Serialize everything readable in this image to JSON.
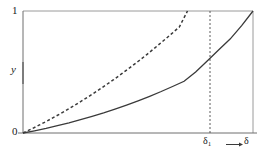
{
  "figure": {
    "background_color": "#ffffff",
    "line_color": "#3a3a3a",
    "frame_color": "#9a9a9a",
    "labels": {
      "y_axis": "y",
      "y_top": "1",
      "origin": "0",
      "x_tick_delta_one_base": "δ",
      "x_tick_delta_one_sub": "1",
      "x_axis_arrow": "⟶",
      "x_axis_name": "δ"
    }
  },
  "chart_data": {
    "type": "line",
    "title": "",
    "xlabel": "δ",
    "ylabel": "y",
    "xlim": [
      0,
      1.155
    ],
    "ylim": [
      0,
      1
    ],
    "grid": false,
    "legend": "none",
    "xticks": [
      {
        "value": 0.826,
        "label": "δ1"
      }
    ],
    "yticks": [
      {
        "value": 0,
        "label": "0"
      },
      {
        "value": 1,
        "label": "1"
      }
    ],
    "annotations": [
      {
        "type": "vertical-dashed-line",
        "x": 0.826,
        "y_from": 0,
        "y_to": 1
      },
      {
        "type": "axis-arrow",
        "text": "⟶ δ",
        "x": 1.02,
        "y": -0.09
      }
    ],
    "series": [
      {
        "name": "dashed-curve",
        "style": "dashed",
        "color": "#3a3a3a",
        "x": [
          0.0,
          0.041,
          0.083,
          0.124,
          0.165,
          0.207,
          0.248,
          0.289,
          0.331,
          0.372,
          0.413,
          0.455,
          0.496,
          0.537,
          0.579,
          0.62,
          0.661,
          0.702,
          0.744,
          0.785,
          0.826
        ],
        "y": [
          0.0,
          0.032,
          0.066,
          0.101,
          0.138,
          0.176,
          0.216,
          0.257,
          0.3,
          0.344,
          0.39,
          0.437,
          0.486,
          0.536,
          0.588,
          0.641,
          0.696,
          0.752,
          0.81,
          0.869,
          1.0
        ]
      },
      {
        "name": "solid-curve",
        "style": "solid",
        "color": "#3a3a3a",
        "x": [
          0.0,
          0.058,
          0.116,
          0.173,
          0.231,
          0.289,
          0.347,
          0.405,
          0.462,
          0.52,
          0.578,
          0.636,
          0.694,
          0.751,
          0.809,
          0.867,
          0.925,
          0.982,
          1.04,
          1.098,
          1.155
        ],
        "y": [
          0.0,
          0.018,
          0.038,
          0.06,
          0.083,
          0.109,
          0.136,
          0.165,
          0.196,
          0.229,
          0.264,
          0.301,
          0.34,
          0.381,
          0.424,
          0.5,
          0.59,
          0.68,
          0.77,
          0.88,
          1.0
        ]
      }
    ]
  }
}
